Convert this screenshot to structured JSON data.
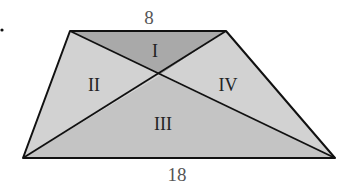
{
  "diagram": {
    "type": "trapezoid-with-diagonals",
    "top_base_label": "8",
    "bottom_base_label": "18",
    "regions": [
      {
        "id": "I",
        "label": "I",
        "fill": "#a9a9a9"
      },
      {
        "id": "II",
        "label": "II",
        "fill": "#d2d2d2"
      },
      {
        "id": "III",
        "label": "III",
        "fill": "#c4c4c4"
      },
      {
        "id": "IV",
        "label": "IV",
        "fill": "#d2d2d2"
      }
    ],
    "stroke_color": "#111111"
  }
}
